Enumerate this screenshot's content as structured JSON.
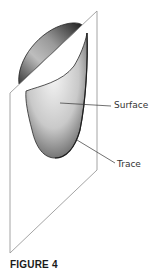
{
  "figure": {
    "caption": "FIGURE 4",
    "labels": {
      "surface": "Surface",
      "trace": "Trace"
    },
    "colors": {
      "plane_edge": "#9a9a9a",
      "surface_dark": "#2a2a2a",
      "surface_light": "#e8e8e8",
      "leader_line": "#333333"
    }
  }
}
